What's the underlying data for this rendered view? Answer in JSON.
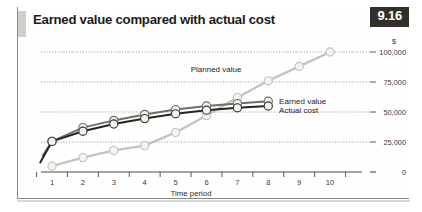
{
  "figure": {
    "title": "Earned value compared with actual cost",
    "number": "9.16"
  },
  "chart_data": {
    "type": "line",
    "title": "Earned value compared with actual cost",
    "xlabel": "Time period",
    "ylabel": "$",
    "unit_label": "$",
    "x": [
      1,
      2,
      3,
      4,
      5,
      6,
      7,
      8,
      9,
      10
    ],
    "categories": [
      "1",
      "2",
      "3",
      "4",
      "5",
      "6",
      "7",
      "8",
      "9",
      "10"
    ],
    "xlim": [
      0.6,
      10.6
    ],
    "ylim": [
      0,
      100000
    ],
    "yticks": [
      0,
      25000,
      50000,
      75000,
      100000
    ],
    "ytick_labels": [
      "0",
      "25,000",
      "50,000",
      "75,000",
      "100,000"
    ],
    "grid": true,
    "grid_style": "dotted",
    "legend_position": "inline-right",
    "series": [
      {
        "name": "Planned value",
        "color": "#c3c3bb",
        "values": [
          5000,
          12000,
          18000,
          22000,
          33000,
          47000,
          62000,
          76000,
          88000,
          100000
        ]
      },
      {
        "name": "Earned value",
        "color": "#6e6e68",
        "values": [
          25500,
          37000,
          43000,
          48000,
          52000,
          55000,
          57000,
          59000,
          null,
          null
        ]
      },
      {
        "name": "Actual cost",
        "color": "#26261f",
        "values": [
          25500,
          34000,
          40000,
          44500,
          48500,
          51500,
          53500,
          55000,
          null,
          null
        ]
      }
    ],
    "annotations": [
      {
        "text": "Planned value",
        "x": 7.0,
        "y": 88000
      },
      {
        "text": "Earned value",
        "x": 8.35,
        "y": 59000
      },
      {
        "text": "Actual cost",
        "x": 8.35,
        "y": 52000
      }
    ]
  }
}
